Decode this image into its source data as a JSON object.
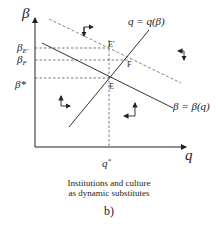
{
  "diagram": {
    "axes": {
      "y_label": "β",
      "x_label": "q"
    },
    "y_ticks": [
      {
        "label": "β",
        "sub": "E'",
        "y": 48
      },
      {
        "label": "β",
        "sub": "F",
        "y": 60
      },
      {
        "label": "β*",
        "sub": "",
        "y": 78
      }
    ],
    "x_ticks": [
      {
        "label": "q*",
        "x": 109
      }
    ],
    "curves": [
      {
        "name": "q-curve",
        "label": "q = q(β)",
        "style": "solid"
      },
      {
        "name": "beta-curve",
        "label": "β = β(q)",
        "style": "solid"
      },
      {
        "name": "shifted-beta-curve",
        "label": "",
        "style": "dashed"
      }
    ],
    "points": [
      {
        "label": "E'",
        "x": 109,
        "y": 48
      },
      {
        "label": "F",
        "x": 128,
        "y": 60
      },
      {
        "label": "E",
        "x": 109,
        "y": 78
      }
    ],
    "caption_line1": "Institutions and culture",
    "caption_line2": "as dynamic substitutes",
    "panel_label": "b)"
  }
}
